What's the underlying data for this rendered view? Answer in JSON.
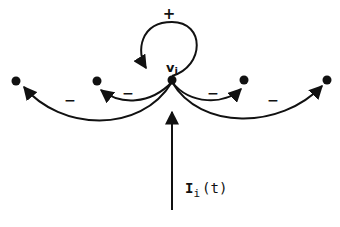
{
  "diagram": {
    "central_node": {
      "label_main": "v",
      "label_sub": "i"
    },
    "self_loop": {
      "sign": "+"
    },
    "edges": [
      {
        "target": "far-left",
        "sign": "−"
      },
      {
        "target": "near-left",
        "sign": "−"
      },
      {
        "target": "near-right",
        "sign": "−"
      },
      {
        "target": "far-right",
        "sign": "−"
      }
    ],
    "input": {
      "label_main": "I",
      "label_sub": "i",
      "label_arg": "(t)"
    },
    "colors": {
      "ink": "#111111",
      "background": "#ffffff"
    }
  }
}
